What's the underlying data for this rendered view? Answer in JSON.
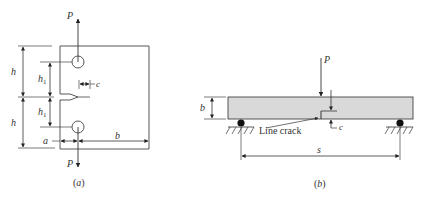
{
  "figure_a": {
    "caption_open": "(",
    "caption_letter": "a",
    "caption_close": ")",
    "load_top": "P",
    "load_bottom": "P",
    "dim_h_upper": "h",
    "dim_h_lower": "h",
    "dim_h1_upper": "h",
    "dim_h1_upper_sub": "1",
    "dim_h1_lower": "h",
    "dim_h1_lower_sub": "1",
    "dim_c": "c",
    "dim_a": "a",
    "dim_b": "b"
  },
  "figure_b": {
    "caption_open": "(",
    "caption_letter": "b",
    "caption_close": ")",
    "load": "P",
    "dim_b": "b",
    "dim_c": "c",
    "dim_s": "s",
    "crack_label": "Line crack"
  },
  "colors": {
    "line": "#333333",
    "beam_fill": "#d9d9d9"
  }
}
